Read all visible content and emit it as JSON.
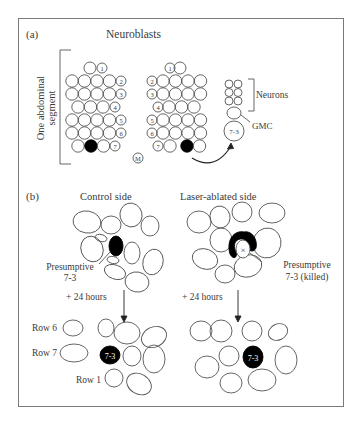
{
  "panel_a": {
    "label": "(a)",
    "title": "Neuroblasts",
    "side_label_line1": "One abdominal",
    "side_label_line2": "segment",
    "left_row_labels": [
      "1",
      "2",
      "3",
      "4",
      "5",
      "6",
      "7"
    ],
    "right_row_labels": [
      "1",
      "2",
      "3",
      "4",
      "5",
      "6",
      "7"
    ],
    "midline_label": "M",
    "lineage_cell_label": "7-3",
    "neurons_label": "Neurons",
    "gmc_label": "GMC"
  },
  "panel_b": {
    "label": "(b)",
    "control_title": "Control side",
    "ablated_title": "Laser-ablated side",
    "control_annotation_line1": "Presumptive",
    "control_annotation_line2": "7-3",
    "ablated_annotation_line1": "Presumptive",
    "ablated_annotation_line2": "7-3 (killed)",
    "ablated_marker": "×",
    "control_time": "+ 24 hours",
    "ablated_time": "+ 24 hours",
    "row_labels": [
      "Row 6",
      "Row 7",
      "Row 1"
    ],
    "control_cell_label": "7-3",
    "ablated_cell_label": "7-3"
  }
}
